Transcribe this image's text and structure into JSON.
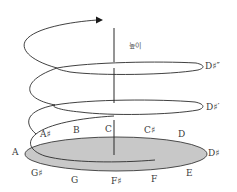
{
  "diagram": {
    "axis_label": "높이",
    "colors": {
      "stroke": "#2b2b2b",
      "base_fill": "#c8c8c8",
      "base_stroke": "#3a3a3a",
      "text": "#3a3a3a"
    },
    "base_circle_notes": [
      {
        "id": "A",
        "label": "A"
      },
      {
        "id": "A_sharp",
        "label": "A♯"
      },
      {
        "id": "B",
        "label": "B"
      },
      {
        "id": "C",
        "label": "C"
      },
      {
        "id": "C_sharp",
        "label": "C♯"
      },
      {
        "id": "D",
        "label": "D"
      },
      {
        "id": "D_sharp",
        "label": "D♯"
      },
      {
        "id": "E",
        "label": "E"
      },
      {
        "id": "F",
        "label": "F"
      },
      {
        "id": "F_sharp",
        "label": "F♯"
      },
      {
        "id": "G",
        "label": "G"
      },
      {
        "id": "G_sharp",
        "label": "G♯"
      }
    ],
    "octave_labels": [
      {
        "id": "D_sharp_prime",
        "label": "D♯′"
      },
      {
        "id": "D_sharp_double_prime",
        "label": "D♯″"
      }
    ]
  }
}
